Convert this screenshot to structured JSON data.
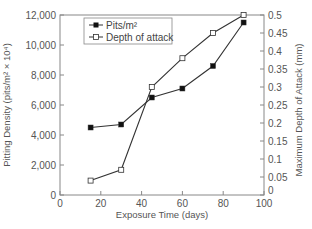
{
  "chart_data": {
    "type": "line",
    "title": "",
    "xlabel": "Exposure Time (days)",
    "ylabel": "Pitting Density (pits/m² × 10⁴)",
    "y2label": "Maximum Depth of Attack (mm)",
    "xlim": [
      0,
      100
    ],
    "ylim": [
      0,
      12000
    ],
    "y2lim": [
      0,
      0.5
    ],
    "x_ticks": [
      0,
      20,
      40,
      60,
      80,
      100
    ],
    "y_ticks": [
      0,
      2000,
      4000,
      6000,
      8000,
      10000,
      12000
    ],
    "y_tick_labels": [
      "0",
      "2,000",
      "4,000",
      "6,000",
      "8,000",
      "10,000",
      "12,000"
    ],
    "y2_ticks": [
      0,
      0.05,
      0.1,
      0.15,
      0.2,
      0.25,
      0.3,
      0.35,
      0.4,
      0.45,
      0.5
    ],
    "y2_tick_labels": [
      "0",
      "0.05",
      "0.1",
      "0.15",
      "0.2",
      "0.25",
      "0.3",
      "0.35",
      "0.4",
      "0.45",
      "0.5"
    ],
    "grid": false,
    "legend_position": "upper left",
    "x": [
      15,
      30,
      45,
      60,
      75,
      90
    ],
    "series": [
      {
        "name": "Pits/m²",
        "axis": "left",
        "marker": "filled-square",
        "values": [
          4500,
          4700,
          6500,
          7100,
          8600,
          11500
        ]
      },
      {
        "name": "Depth of attack",
        "axis": "right",
        "marker": "open-square",
        "values": [
          0.04,
          0.07,
          0.3,
          0.38,
          0.45,
          0.5
        ]
      }
    ]
  },
  "colors": {
    "axis": "#888888",
    "line": "#333333",
    "marker_fill_filled": "#111111",
    "marker_fill_open": "#ffffff",
    "text": "#555555"
  }
}
